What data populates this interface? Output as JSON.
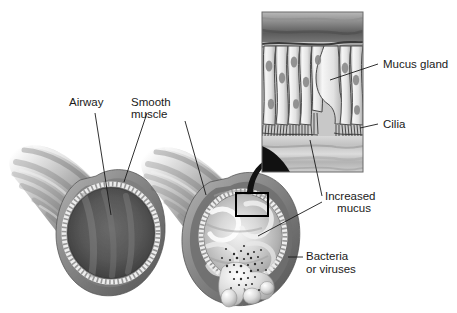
{
  "figure": {
    "background_color": "#ffffff",
    "text_color": "#1a1a1a",
    "line_color": "#1a1a1a",
    "width": 457,
    "height": 313
  },
  "labels": {
    "airway": "Airway",
    "smooth_muscle_line1": "Smooth",
    "smooth_muscle_line2": "muscle",
    "mucus_gland": "Mucus gland",
    "cilia": "Cilia",
    "increased_mucus_line1": "Increased",
    "increased_mucus_line2": "mucus",
    "bacteria_line1": "Bacteria",
    "bacteria_line2": "or viruses"
  },
  "panels": {
    "normal_airway": {
      "name": "normal-airway",
      "description": "Normal airway tube shown in cross-section with open dark lumen",
      "lumen_color": "#4d4d4d",
      "muscle_color": "#8c8c8c",
      "epithelium_color": "#e8e8e8"
    },
    "inflamed_airway": {
      "name": "inflamed-airway",
      "description": "Inflamed airway with narrowed lumen filled with mucus, mucus dripping out",
      "mucus_color": "#d6d6d6",
      "muscle_color": "#7a7a7a"
    },
    "epithelium_inset": {
      "name": "epithelium-inset",
      "description": "Magnified view of airway epithelium showing columnar cells, mucus gland, cilia and mucus layer",
      "border_color": "#555555",
      "cell_color": "#f0f0f0",
      "submucosa_color": "#6e6e6e",
      "mucus_layer_color": "#c9c9c9"
    },
    "callout_box": {
      "name": "callout-box",
      "description": "Black rectangle marking the magnified region on the inflamed airway"
    },
    "magnify_arrow": {
      "name": "magnify-arrow",
      "description": "Curved black arrow pointing from callout box to the magnified inset"
    },
    "bacteria_cluster": {
      "name": "bacteria-cluster",
      "description": "Scattered dark stipple dots representing bacteria or viruses in expelled mucus"
    }
  },
  "icon_names": {
    "arrow": "curved-arrow-icon",
    "leader": "leader-line-icon"
  }
}
